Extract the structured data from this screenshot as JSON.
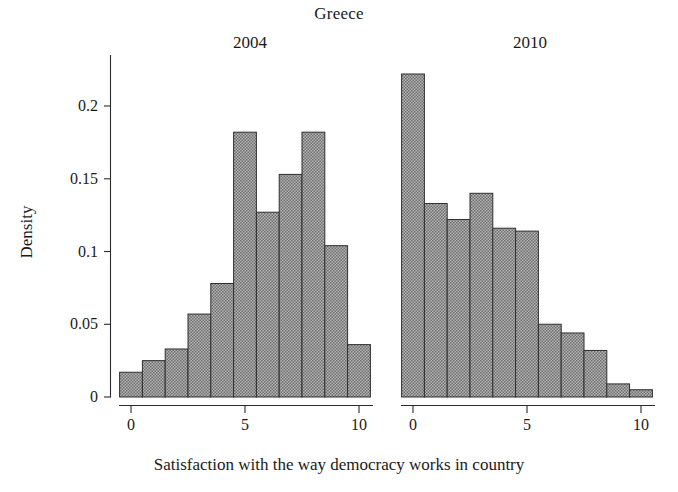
{
  "title": "Greece",
  "axis": {
    "ylabel": "Density",
    "xlabel": "Satisfaction with the way democracy works in country",
    "yticks": [
      "0",
      "0.05",
      "0.1",
      "0.15",
      "0.2"
    ],
    "xticks": [
      "0",
      "5",
      "10"
    ]
  },
  "colors": {
    "bar_fill": "#9a9a9a",
    "bar_stroke": "#2f2f2f",
    "axis": "#2b2b2b",
    "background": "#ffffff",
    "text": "#1a1a1a"
  },
  "panels": [
    {
      "label": "2004"
    },
    {
      "label": "2010"
    }
  ],
  "chart_data": {
    "type": "bar",
    "title": "Greece",
    "xlabel": "Satisfaction with the way democracy works in country",
    "ylabel": "Density",
    "ylim": [
      0,
      0.235
    ],
    "grid": false,
    "legend": null,
    "note": "Two-panel histogram of satisfaction with democracy (0-10 scale), densities per bin",
    "panels": [
      {
        "name": "2004",
        "xlim": [
          -0.5,
          10.5
        ],
        "xticks": [
          0,
          5,
          10
        ],
        "yticks": [
          0,
          0.05,
          0.1,
          0.15,
          0.2
        ],
        "categories": [
          0,
          1,
          2,
          3,
          4,
          5,
          6,
          7,
          8,
          9,
          10
        ],
        "values": [
          0.017,
          0.025,
          0.033,
          0.057,
          0.078,
          0.182,
          0.127,
          0.153,
          0.182,
          0.104,
          0.036
        ]
      },
      {
        "name": "2010",
        "xlim": [
          -0.5,
          10.5
        ],
        "xticks": [
          0,
          5,
          10
        ],
        "yticks": [
          0,
          0.05,
          0.1,
          0.15,
          0.2
        ],
        "categories": [
          0,
          1,
          2,
          3,
          4,
          5,
          6,
          7,
          8,
          9,
          10
        ],
        "values": [
          0.222,
          0.133,
          0.122,
          0.14,
          0.116,
          0.114,
          0.05,
          0.044,
          0.032,
          0.009,
          0.005
        ]
      }
    ]
  }
}
